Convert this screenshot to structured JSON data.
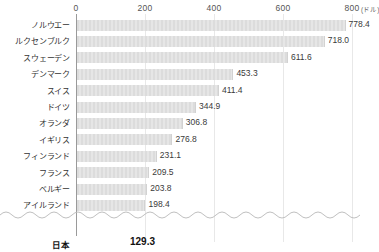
{
  "chart_data": {
    "type": "bar",
    "orientation": "horizontal",
    "title": "",
    "xlabel": "",
    "ylabel": "",
    "unit_label": "(ドル)",
    "xlim": [
      0,
      800
    ],
    "xticks": [
      0,
      200,
      400,
      600,
      800
    ],
    "xtick_labels": [
      "0",
      "200",
      "400",
      "600",
      "800"
    ],
    "grid": true,
    "legend": "none",
    "axis_break": true,
    "categories": [
      "ノルウエー",
      "ルクセンブルク",
      "スウェーデン",
      "デンマーク",
      "スイス",
      "ドイツ",
      "オランダ",
      "イギリス",
      "フィンランド",
      "フランス",
      "ベルギー",
      "アイルランド",
      "日本"
    ],
    "values": [
      778.4,
      718.0,
      611.6,
      453.3,
      411.4,
      344.9,
      306.8,
      276.8,
      231.1,
      209.5,
      203.8,
      198.4,
      129.3
    ],
    "value_labels": [
      "778.4",
      "718.0",
      "611.6",
      "453.3",
      "411.4",
      "344.9",
      "306.8",
      "276.8",
      "231.1",
      "209.5",
      "203.8",
      "198.4",
      "129.3"
    ],
    "highlight_index": 12,
    "bar_color": "#dcdcdc",
    "highlight_bar_color": "#ffffff",
    "grid_color": "#e8e8e8",
    "axis_color": "#9a9a9a",
    "text_color": "#333333"
  }
}
